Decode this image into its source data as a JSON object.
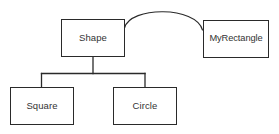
{
  "diagram": {
    "background_color": "#ffffff",
    "line_color": "#2a2a2a",
    "text_color": "#333333",
    "width": 279,
    "height": 134,
    "nodes": [
      {
        "id": "shape",
        "label": "Shape",
        "x": 61,
        "y": 19,
        "w": 64,
        "h": 38
      },
      {
        "id": "myrectangle",
        "label": "MyRectangle",
        "x": 203,
        "y": 20,
        "w": 66,
        "h": 38
      },
      {
        "id": "square",
        "label": "Square",
        "x": 10,
        "y": 87,
        "w": 64,
        "h": 38
      },
      {
        "id": "circle",
        "label": "Circle",
        "x": 113,
        "y": 87,
        "w": 64,
        "h": 38
      }
    ],
    "edges": [
      {
        "id": "shape-myrectangle",
        "from": "shape",
        "to": "myrectangle",
        "style": "curved-arc"
      },
      {
        "id": "shape-square",
        "from": "shape",
        "to": "square",
        "style": "orthogonal-tree"
      },
      {
        "id": "shape-circle",
        "from": "shape",
        "to": "circle",
        "style": "orthogonal-tree"
      }
    ]
  }
}
